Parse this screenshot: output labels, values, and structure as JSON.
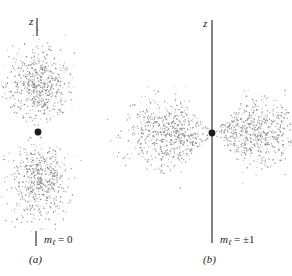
{
  "figure": {
    "panels": [
      {
        "id": "a",
        "caption": "(a)",
        "axis_label": "z",
        "m_symbol": "m",
        "m_subscript": "ℓ",
        "m_value": "= 0",
        "nucleus": {
          "x": 38,
          "y": 132
        },
        "lobes": [
          {
            "cx": 38,
            "cy": 85,
            "rx": 34,
            "ry": 42,
            "count": 620
          },
          {
            "cx": 38,
            "cy": 180,
            "rx": 34,
            "ry": 42,
            "count": 620
          }
        ]
      },
      {
        "id": "b",
        "caption": "(b)",
        "axis_label": "z",
        "m_symbol": "m",
        "m_subscript": "ℓ",
        "m_value": "= ±1",
        "nucleus": {
          "x": 212,
          "y": 133
        },
        "lobes": [
          {
            "cx": 172,
            "cy": 133,
            "rx": 50,
            "ry": 34,
            "count": 700
          },
          {
            "cx": 252,
            "cy": 133,
            "rx": 50,
            "ry": 34,
            "count": 700
          }
        ]
      }
    ],
    "colors": {
      "dots": "#7a7a7a",
      "axis": "#333333",
      "nucleus": "#1a1a1a"
    }
  }
}
